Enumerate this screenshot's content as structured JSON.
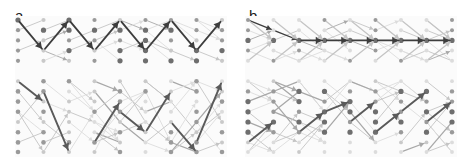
{
  "figure": {
    "width": 465,
    "height": 165,
    "background": "#ffffff",
    "panel_background": "#fbfbfb"
  },
  "panels": [
    {
      "id": "a",
      "label": "a",
      "x": 0,
      "width": 232,
      "plot": {
        "x": 18,
        "y": 20,
        "width": 204,
        "height": 132
      }
    },
    {
      "id": "b",
      "label": "b",
      "x": 232,
      "width": 233,
      "plot": {
        "x": 16,
        "y": 20,
        "width": 204,
        "height": 132
      }
    }
  ],
  "style": {
    "node_fill_dark": "#6e6e6e",
    "node_fill_mid": "#9a9a9a",
    "node_fill_light": "#c9c9c9",
    "node_fill_faint": "#dcdcdc",
    "edge_faint": "#dcdcdc",
    "edge_light": "#c4c4c4",
    "edge_mid": "#a8a8a8",
    "edge_dark": "#5a5a5a",
    "edge_darkest": "#3d3d3d",
    "node_radius_large": 2.6,
    "node_radius_small": 1.6,
    "edge_width_thin": 0.9,
    "edge_width_mid": 1.3,
    "edge_width_thick": 1.9
  },
  "chart_data": {
    "type": "scatter",
    "title": "",
    "xlabel": "",
    "ylabel": "",
    "grid": {
      "columns": 9,
      "rows": 14,
      "col_spacing": 25.5,
      "row_spacing": 10.2
    },
    "panel_a": {
      "label": "a",
      "upper_block_rows": [
        0,
        1,
        2,
        3,
        4
      ],
      "lower_block_rows": [
        6,
        7,
        8,
        9,
        10,
        11,
        12,
        13
      ],
      "highlighted_path_style": "zigzag",
      "node_columns_x": [
        0,
        25.5,
        51,
        76.5,
        102,
        127.5,
        153,
        178.5,
        204
      ],
      "node_rows_y": [
        0,
        10.2,
        20.4,
        30.6,
        40.8,
        51,
        61.2,
        71.4,
        81.6,
        91.8,
        102,
        112.2,
        122.4,
        132
      ]
    },
    "panel_b": {
      "label": "b",
      "upper_block_rows": [
        0,
        1,
        2,
        3,
        4
      ],
      "lower_block_rows": [
        6,
        7,
        8,
        9,
        10,
        11,
        12,
        13
      ],
      "highlighted_path_style": "horizontal-chain",
      "chain_row": 2,
      "node_columns_x": [
        0,
        25.5,
        51,
        76.5,
        102,
        127.5,
        153,
        178.5,
        204
      ],
      "node_rows_y": [
        0,
        10.2,
        20.4,
        30.6,
        40.8,
        51,
        61.2,
        71.4,
        81.6,
        91.8,
        102,
        112.2,
        122.4,
        132
      ]
    }
  }
}
